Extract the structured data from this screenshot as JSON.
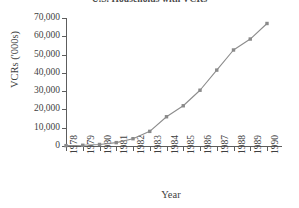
{
  "chart": {
    "title": "U.S. Households with VCRs",
    "xlabel": "Year",
    "ylabel": "VCRs ('000s)"
  },
  "chart_data": {
    "type": "line",
    "title": "U.S. Households with VCRs",
    "xlabel": "Year",
    "ylabel": "VCRs ('000s)",
    "categories": [
      "1978",
      "1979",
      "1980",
      "1981",
      "1982",
      "1983",
      "1984",
      "1985",
      "1986",
      "1987",
      "1988",
      "1989",
      "1990"
    ],
    "values": [
      200,
      400,
      840,
      1850,
      4000,
      8000,
      16000,
      22000,
      30500,
      41500,
      52500,
      58500,
      67000
    ],
    "series": [
      {
        "name": "VCRs ('000s)",
        "values": [
          200,
          400,
          840,
          1850,
          4000,
          8000,
          16000,
          22000,
          30500,
          41500,
          52500,
          58500,
          67000
        ]
      }
    ],
    "ylim": [
      0,
      70000
    ],
    "yticks": [
      0,
      10000,
      20000,
      30000,
      40000,
      50000,
      60000,
      70000
    ],
    "ytick_labels": [
      "0",
      "10,000",
      "20,000",
      "30,000",
      "40,000",
      "50,000",
      "60,000",
      "70,000"
    ],
    "grid": false,
    "legend": "none",
    "marker": "square",
    "line_color": "#8c8c8c",
    "marker_color": "#8a8a8a",
    "axis_color": "#5d5d5d"
  }
}
